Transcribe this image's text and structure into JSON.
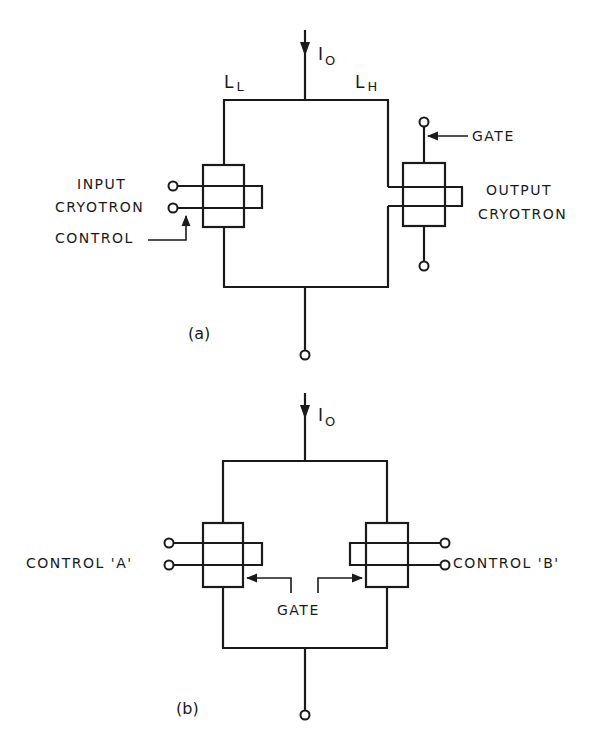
{
  "figure": {
    "part_a": {
      "caption": "(a)",
      "current_symbol": "I",
      "current_subscript": "O",
      "left_inductance": {
        "symbol": "L",
        "subscript": "L"
      },
      "right_inductance": {
        "symbol": "L",
        "subscript": "H"
      },
      "input_label_line1": "INPUT",
      "input_label_line2": "CRYOTRON",
      "control_label": "CONTROL",
      "gate_label": "GATE",
      "output_label_line1": "OUTPUT",
      "output_label_line2": "CRYOTRON"
    },
    "part_b": {
      "caption": "(b)",
      "current_symbol": "I",
      "current_subscript": "O",
      "control_a_label": "CONTROL 'A'",
      "control_b_label": "CONTROL 'B'",
      "gate_label": "GATE"
    },
    "colors": {
      "line": "#1a1a1a",
      "background": "#ffffff"
    }
  }
}
